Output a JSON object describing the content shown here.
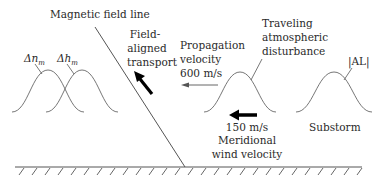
{
  "diagram": {
    "title_label": "Magnetic field line",
    "field_aligned": [
      "Field-",
      "aligned",
      "transport"
    ],
    "propagation": [
      "Propagation",
      "velocity",
      "600 m/s"
    ],
    "tad": [
      "Traveling",
      "atmospheric",
      "disturbance"
    ],
    "al_label": "|AL|",
    "dn_label": "Δn",
    "dn_sub": "m",
    "dh_label": "Δh",
    "dh_sub": "m",
    "wind_speed": "150 m/s",
    "wind_label": [
      "Meridional",
      "wind velocity"
    ],
    "substorm_label": "Substorm",
    "colors": {
      "line": "#555555",
      "text": "#2a2a2a",
      "arrow": "#000000"
    }
  }
}
